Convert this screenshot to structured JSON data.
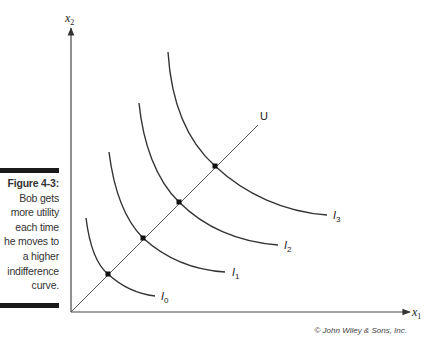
{
  "caption": {
    "figure_label": "Figure 4-3:",
    "text_lines": [
      "Bob gets",
      "more utility",
      "each time",
      "he moves to",
      "a higher",
      "indifference",
      "curve."
    ]
  },
  "axes": {
    "x": {
      "label": "x",
      "subscript": "1"
    },
    "y": {
      "label": "x",
      "subscript": "2"
    }
  },
  "utility_line": {
    "label": "U"
  },
  "indifference_curves": [
    {
      "name": "I",
      "subscript": "0"
    },
    {
      "name": "I",
      "subscript": "1"
    },
    {
      "name": "I",
      "subscript": "2"
    },
    {
      "name": "I",
      "subscript": "3"
    }
  ],
  "copyright": "© John Wiley & Sons, Inc.",
  "colors": {
    "line": "#333333",
    "text": "#222222",
    "bar": "#1a1a1a"
  }
}
